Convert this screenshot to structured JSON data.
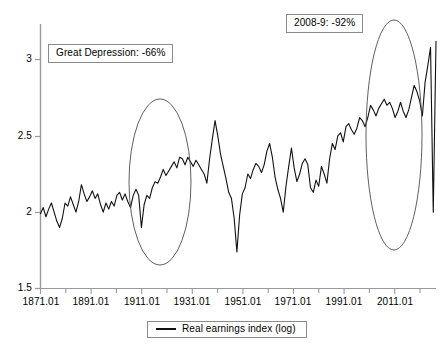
{
  "chart_data": {
    "type": "line",
    "title": "",
    "subtitle": "",
    "xlabel": "",
    "ylabel": "",
    "xlim": [
      1871,
      2016
    ],
    "ylim": [
      1.5,
      3.2
    ],
    "grid": false,
    "legend_position": "bottom",
    "x_tick_labels": [
      "1871.01",
      "1891.01",
      "1911.01",
      "1931.01",
      "1951.01",
      "1971.01",
      "1991.01",
      "2011.01"
    ],
    "x_tick_values": [
      1871,
      1891,
      1911,
      1931,
      1951,
      1971,
      1991,
      2011
    ],
    "y_tick_labels": [
      "1.5",
      "2",
      "2.5",
      "3"
    ],
    "y_tick_values": [
      1.5,
      2.0,
      2.5,
      3.0
    ],
    "minor_tick_interval_years": 10,
    "series": [
      {
        "name": "Real earnings index (log)",
        "color": "#111111",
        "x": [
          1871,
          1872,
          1873,
          1874,
          1875,
          1876,
          1877,
          1878,
          1879,
          1880,
          1881,
          1882,
          1883,
          1884,
          1885,
          1886,
          1887,
          1888,
          1889,
          1890,
          1891,
          1892,
          1893,
          1894,
          1895,
          1896,
          1897,
          1898,
          1899,
          1900,
          1901,
          1902,
          1903,
          1904,
          1905,
          1906,
          1907,
          1908,
          1909,
          1910,
          1911,
          1912,
          1913,
          1914,
          1915,
          1916,
          1917,
          1918,
          1919,
          1920,
          1921,
          1922,
          1923,
          1924,
          1925,
          1926,
          1927,
          1928,
          1929,
          1930,
          1931,
          1932,
          1933,
          1934,
          1935,
          1936,
          1937,
          1938,
          1939,
          1940,
          1941,
          1942,
          1943,
          1944,
          1945,
          1946,
          1947,
          1948,
          1949,
          1950,
          1951,
          1952,
          1953,
          1954,
          1955,
          1956,
          1957,
          1958,
          1959,
          1960,
          1961,
          1962,
          1963,
          1964,
          1965,
          1966,
          1967,
          1968,
          1969,
          1970,
          1971,
          1972,
          1973,
          1974,
          1975,
          1976,
          1977,
          1978,
          1979,
          1980,
          1981,
          1982,
          1983,
          1984,
          1985,
          1986,
          1987,
          1988,
          1989,
          1990,
          1991,
          1992,
          1993,
          1994,
          1995,
          1996,
          1997,
          1998,
          1999,
          2000,
          2001,
          2002,
          2003,
          2004,
          2005,
          2006,
          2007,
          2008,
          2009,
          2010,
          2011,
          2012,
          2013,
          2014,
          2015,
          2016
        ],
        "y": [
          1.99,
          2.03,
          1.97,
          2.02,
          2.06,
          2.0,
          1.94,
          1.9,
          1.96,
          2.06,
          2.04,
          2.1,
          2.05,
          2.0,
          2.07,
          2.18,
          2.12,
          2.07,
          2.1,
          2.14,
          2.09,
          2.12,
          2.05,
          2.0,
          2.06,
          2.02,
          2.07,
          2.04,
          2.11,
          2.13,
          2.08,
          2.12,
          2.07,
          2.03,
          2.11,
          2.15,
          2.11,
          1.9,
          2.05,
          2.11,
          2.09,
          2.16,
          2.2,
          2.19,
          2.23,
          2.28,
          2.24,
          2.27,
          2.3,
          2.33,
          2.29,
          2.36,
          2.35,
          2.31,
          2.36,
          2.33,
          2.3,
          2.34,
          2.31,
          2.28,
          2.25,
          2.19,
          2.35,
          2.48,
          2.6,
          2.5,
          2.38,
          2.3,
          2.22,
          2.13,
          2.09,
          1.96,
          1.74,
          1.98,
          2.12,
          2.16,
          2.25,
          2.22,
          2.28,
          2.32,
          2.3,
          2.26,
          2.31,
          2.4,
          2.45,
          2.36,
          2.23,
          2.15,
          2.09,
          2.0,
          2.17,
          2.3,
          2.42,
          2.29,
          2.2,
          2.25,
          2.32,
          2.35,
          2.31,
          2.16,
          2.13,
          2.21,
          2.17,
          2.3,
          2.25,
          2.19,
          2.35,
          2.45,
          2.41,
          2.5,
          2.52,
          2.46,
          2.56,
          2.58,
          2.54,
          2.51,
          2.55,
          2.62,
          2.6,
          2.56,
          2.62,
          2.7,
          2.67,
          2.63,
          2.68,
          2.71,
          2.74,
          2.7,
          2.72,
          2.68,
          2.62,
          2.66,
          2.72,
          2.66,
          2.62,
          2.67,
          2.75,
          2.83,
          2.79,
          2.73,
          2.63,
          2.85,
          2.96,
          3.08,
          2.0,
          3.12
        ],
        "notes": "Monthly real earnings index on log scale; two sharp collapses highlighted"
      }
    ],
    "annotations": [
      {
        "id": "great-depression",
        "text": "Great Depression: -66%",
        "box_x": 48,
        "box_y": 44
      },
      {
        "id": "crash-2008-9",
        "text": "2008-9: -92%",
        "box_x": 286,
        "box_y": 14
      }
    ],
    "highlight_ellipses": [
      {
        "id": "great-depression-ellipse",
        "cx": 160,
        "cy": 182,
        "rx": 31,
        "ry": 83
      },
      {
        "id": "crash-2008-9-ellipse",
        "cx": 394,
        "cy": 135,
        "rx": 28,
        "ry": 115
      }
    ],
    "legend": [
      {
        "label": "Real earnings index (log)",
        "color": "#111111"
      }
    ]
  },
  "axis_colors": {
    "axis_line": "#9a9a9a",
    "tick": "#9a9a9a",
    "annotation_border": "#8a8a8a",
    "series": "#111111"
  }
}
